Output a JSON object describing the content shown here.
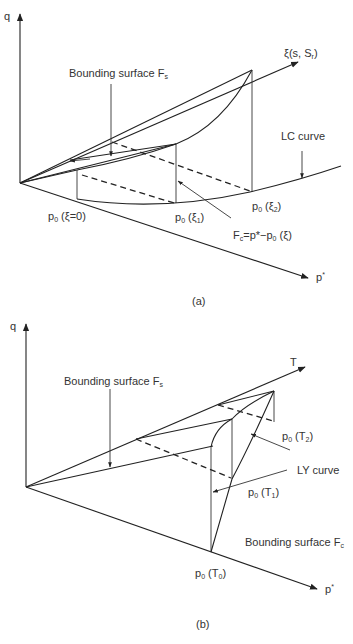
{
  "panel_a": {
    "caption": "(a)",
    "axis_q": "q",
    "axis_p": "p",
    "axis_p_sup": "*",
    "axis_xi": "ξ(s, S",
    "axis_xi_sub": "r",
    "axis_xi_end": ")",
    "label_bounding_fs": "Bounding surface F",
    "label_bounding_fs_sub": "s",
    "label_lc": "LC curve",
    "label_p0_xi0": "p",
    "label_p0_xi0_sub": "0",
    "label_p0_xi0_arg": " (ξ=0)",
    "label_p0_xi1": "p",
    "label_p0_xi1_sub": "0",
    "label_p0_xi1_arg_pre": " (ξ",
    "label_p0_xi1_arg_sub": "1",
    "label_p0_xi1_arg_post": ")",
    "label_p0_xi2": "p",
    "label_p0_xi2_sub": "0",
    "label_p0_xi2_arg_pre": " (ξ",
    "label_p0_xi2_arg_sub": "2",
    "label_p0_xi2_arg_post": ")",
    "label_fc_pre": "F",
    "label_fc_sub": "c",
    "label_fc_post": "=p*−p",
    "label_fc_sub2": "0",
    "label_fc_end": " (ξ)"
  },
  "panel_b": {
    "caption": "(b)",
    "axis_q": "q",
    "axis_p": "p",
    "axis_p_sup": "*",
    "axis_t": "T",
    "label_bounding_fs": "Bounding surface F",
    "label_bounding_fs_sub": "s",
    "label_ly": "LY curve",
    "label_p0_t2": "p",
    "label_p0_t2_sub": "0",
    "label_p0_t2_arg_pre": " (T",
    "label_p0_t2_arg_sub": "2",
    "label_p0_t2_arg_post": ")",
    "label_p0_t1": "p",
    "label_p0_t1_sub": "0",
    "label_p0_t1_arg_pre": " (T",
    "label_p0_t1_arg_sub": "1",
    "label_p0_t1_arg_post": ")",
    "label_p0_t0": "p",
    "label_p0_t0_sub": "0",
    "label_p0_t0_arg_pre": " (T",
    "label_p0_t0_arg_sub": "0",
    "label_p0_t0_arg_post": ")",
    "label_bounding_fc": "Bounding surface F",
    "label_bounding_fc_sub": "c"
  }
}
